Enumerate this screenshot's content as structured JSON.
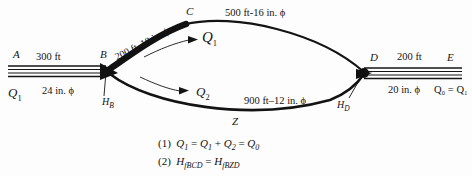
{
  "figure": {
    "type": "pipe-network-diagram",
    "background_color": "#fdfdfd",
    "line_color": "#111111"
  },
  "nodes": [
    {
      "id": "A",
      "label": "A",
      "x": 14,
      "y": 55
    },
    {
      "id": "B",
      "label": "B",
      "x": 101,
      "y": 55
    },
    {
      "id": "C",
      "label": "C",
      "x": 186,
      "y": 12
    },
    {
      "id": "D",
      "label": "D",
      "x": 369,
      "y": 58
    },
    {
      "id": "E",
      "label": "E",
      "x": 446,
      "y": 58
    },
    {
      "id": "Z",
      "label": "Z",
      "x": 234,
      "y": 122
    }
  ],
  "segments": {
    "ab": {
      "length_label": "300 ft",
      "diameter_label": "24 in. ϕ",
      "flow_label": "Q",
      "flow_sub": "1"
    },
    "bc": {
      "combined_label": "200 ft–18 in. ϕ",
      "style": "thick"
    },
    "cd": {
      "combined_label": "500 ft-16 in. ϕ",
      "style": "thin"
    },
    "bzd": {
      "combined_label": "900 ft–12 in. ϕ",
      "style": "medium"
    },
    "de": {
      "length_label": "200 ft",
      "diameter_label": "20 in. ϕ",
      "flow_label": "Q₀ = Q₁"
    }
  },
  "flow_arrows": [
    {
      "name": "upper-branch-flow",
      "label": "Q",
      "sub": "1",
      "x": 198,
      "y": 36
    },
    {
      "name": "lower-branch-flow",
      "label": "Q",
      "sub": "2",
      "x": 196,
      "y": 91
    }
  ],
  "head_labels": [
    {
      "name": "head-at-B",
      "label": "H",
      "sub": "B",
      "x": 105,
      "y": 99
    },
    {
      "name": "head-at-D",
      "label": "H",
      "sub": "D",
      "x": 340,
      "y": 104
    }
  ],
  "equations": [
    {
      "number": "(1)",
      "text_html": "(1)&nbsp; <i>Q</i><sub>1</sub> = <i>Q</i><sub>1</sub> + <i>Q</i><sub>2</sub> = <i>Q</i><sub>0</sub>",
      "plain": "(1) Q1 = Q1 + Q2 = Q0"
    },
    {
      "number": "(2)",
      "text_html": "(2)&nbsp; <i>H</i><sub><i>fBCD</i></sub> = <i>H</i><sub><i>fBZD</i></sub>",
      "plain": "(2) HfBCD = HfBZD"
    }
  ],
  "inline_text": {
    "ab_length": "300 ft",
    "ab_diameter": "24 in. ϕ",
    "ab_flow": "Q",
    "ab_flow_sub": "1",
    "bc_label": "200 ft–18 in. ϕ",
    "cd_label": "500 ft-16 in. ϕ",
    "bzd_label": "900 ft–12 in. ϕ",
    "de_length": "200 ft",
    "de_diameter": "20 in. ϕ",
    "de_flow": "Q₀ = Q₁"
  }
}
